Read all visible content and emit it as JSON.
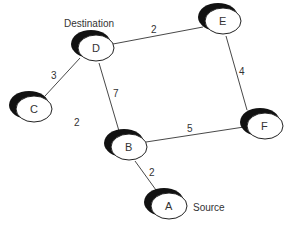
{
  "diagram": {
    "type": "weighted-undirected-graph",
    "nodes": [
      {
        "id": "D",
        "label": "D",
        "annotation": "Destination",
        "x": 95,
        "y": 47
      },
      {
        "id": "E",
        "label": "E",
        "x": 222,
        "y": 20
      },
      {
        "id": "C",
        "label": "C",
        "x": 33,
        "y": 108
      },
      {
        "id": "B",
        "label": "B",
        "x": 128,
        "y": 146
      },
      {
        "id": "F",
        "label": "F",
        "x": 264,
        "y": 125
      },
      {
        "id": "A",
        "label": "A",
        "annotation": "Source",
        "x": 168,
        "y": 205
      }
    ],
    "edges": [
      {
        "from": "D",
        "to": "E",
        "weight": "2"
      },
      {
        "from": "D",
        "to": "C",
        "weight": "3"
      },
      {
        "from": "D",
        "to": "B",
        "weight": "7"
      },
      {
        "from": "E",
        "to": "F",
        "weight": "4"
      },
      {
        "from": "B",
        "to": "F",
        "weight": "5"
      },
      {
        "from": "B",
        "to": "A",
        "weight": "2"
      }
    ],
    "stray_labels": [
      {
        "text": "2",
        "x": 77,
        "y": 126
      }
    ],
    "annotations": {
      "destination": "Destination",
      "source": "Source"
    },
    "colors": {
      "line": "#333333",
      "node_shadow": "#111111",
      "node_fill": "#ffffff"
    }
  }
}
